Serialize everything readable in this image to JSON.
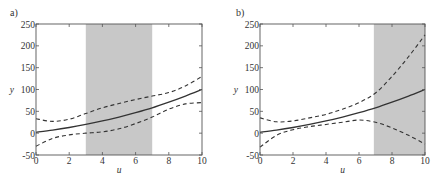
{
  "figure": {
    "panels": [
      "a)",
      "b)"
    ]
  },
  "chart_data": [
    {
      "type": "line",
      "panel_label": "a)",
      "title": "",
      "xlabel": "u",
      "ylabel": "y",
      "xlim": [
        0,
        10
      ],
      "ylim": [
        -50,
        250
      ],
      "xticks": [
        0,
        2,
        4,
        6,
        8,
        10
      ],
      "yticks": [
        -50,
        0,
        50,
        100,
        150,
        200,
        250
      ],
      "grid": false,
      "legend": null,
      "shaded_region": {
        "x_start": 3,
        "x_end": 7,
        "color": "#c8c8c8"
      },
      "x": [
        0,
        1,
        2,
        3,
        4,
        5,
        6,
        7,
        8,
        9,
        10
      ],
      "series": [
        {
          "name": "mean",
          "style": "solid",
          "values": [
            2,
            7,
            13,
            20,
            28,
            37,
            47,
            58,
            71,
            85,
            100
          ]
        },
        {
          "name": "upper bound",
          "style": "dashed",
          "values": [
            33,
            27,
            32,
            45,
            58,
            68,
            77,
            85,
            93,
            108,
            130
          ]
        },
        {
          "name": "lower bound",
          "style": "dashed",
          "values": [
            -30,
            -12,
            -4,
            0,
            3,
            10,
            22,
            37,
            55,
            67,
            70
          ]
        }
      ]
    },
    {
      "type": "line",
      "panel_label": "b)",
      "title": "",
      "xlabel": "u",
      "ylabel": "y",
      "xlim": [
        0,
        10
      ],
      "ylim": [
        -50,
        250
      ],
      "xticks": [
        0,
        2,
        4,
        6,
        8,
        10
      ],
      "yticks": [
        -50,
        0,
        50,
        100,
        150,
        200,
        250
      ],
      "grid": false,
      "legend": null,
      "shaded_region": {
        "x_start": 6.9,
        "x_end": 10,
        "color": "#c8c8c8"
      },
      "x": [
        0,
        1,
        2,
        3,
        4,
        5,
        6,
        7,
        8,
        9,
        10
      ],
      "series": [
        {
          "name": "mean",
          "style": "solid",
          "values": [
            2,
            7,
            13,
            20,
            28,
            37,
            47,
            58,
            71,
            85,
            100
          ]
        },
        {
          "name": "upper bound",
          "style": "dashed",
          "values": [
            35,
            26,
            28,
            35,
            43,
            55,
            70,
            92,
            130,
            175,
            225
          ]
        },
        {
          "name": "lower bound",
          "style": "dashed",
          "values": [
            -32,
            -5,
            8,
            15,
            20,
            25,
            30,
            25,
            12,
            -5,
            -25
          ]
        }
      ]
    }
  ]
}
